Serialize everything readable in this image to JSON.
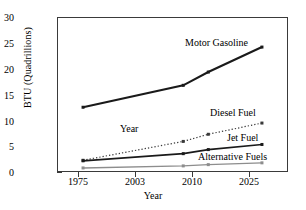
{
  "chart_data": {
    "type": "line",
    "title": "",
    "xlabel": "Year",
    "ylabel": "BTU (Quadrillions)",
    "categories": [
      "1975",
      "2003",
      "2010",
      "2025"
    ],
    "x": [
      1975,
      2003,
      2010,
      2025
    ],
    "xlim": [
      1968,
      2032
    ],
    "ylim": [
      0,
      30
    ],
    "yticks": [
      0,
      5,
      10,
      15,
      20,
      25,
      30
    ],
    "grid": false,
    "legend": "in-plot annotations",
    "annotations": [
      "Year"
    ],
    "series": [
      {
        "name": "Motor Gasoline",
        "values": [
          12.5,
          16.8,
          19.4,
          24.3
        ],
        "color": "#1a1a1a",
        "style": "solid",
        "width": 2.1,
        "marker": "square"
      },
      {
        "name": "Diesel Fuel",
        "values": [
          2.1,
          5.8,
          7.2,
          9.4
        ],
        "color": "#3a3a3a",
        "style": "dotted",
        "width": 1.2,
        "marker": "square"
      },
      {
        "name": "Jet Fuel",
        "values": [
          2.0,
          3.4,
          4.2,
          5.2
        ],
        "color": "#1a1a1a",
        "style": "solid",
        "width": 1.7,
        "marker": "square"
      },
      {
        "name": "Alternative Fuels",
        "values": [
          0.6,
          1.0,
          1.25,
          1.6
        ],
        "color": "#8d8d8d",
        "style": "solid",
        "width": 1.4,
        "marker": "square"
      }
    ]
  },
  "labels": {
    "motor_gasoline": "Motor Gasoline",
    "diesel_fuel": "Diesel Fuel",
    "jet_fuel": "Jet Fuel",
    "alternative_fuels": "Alternative Fuels",
    "year_annotation": "Year"
  },
  "axis": {
    "y_title": "BTU (Quadrillions)",
    "x_title": "Year",
    "y_0": "0",
    "y_5": "5",
    "y_10": "10",
    "y_15": "15",
    "y_20": "20",
    "y_25": "25",
    "y_30": "30",
    "x_1975": "1975",
    "x_2003": "2003",
    "x_2010": "2010",
    "x_2025": "2025"
  }
}
